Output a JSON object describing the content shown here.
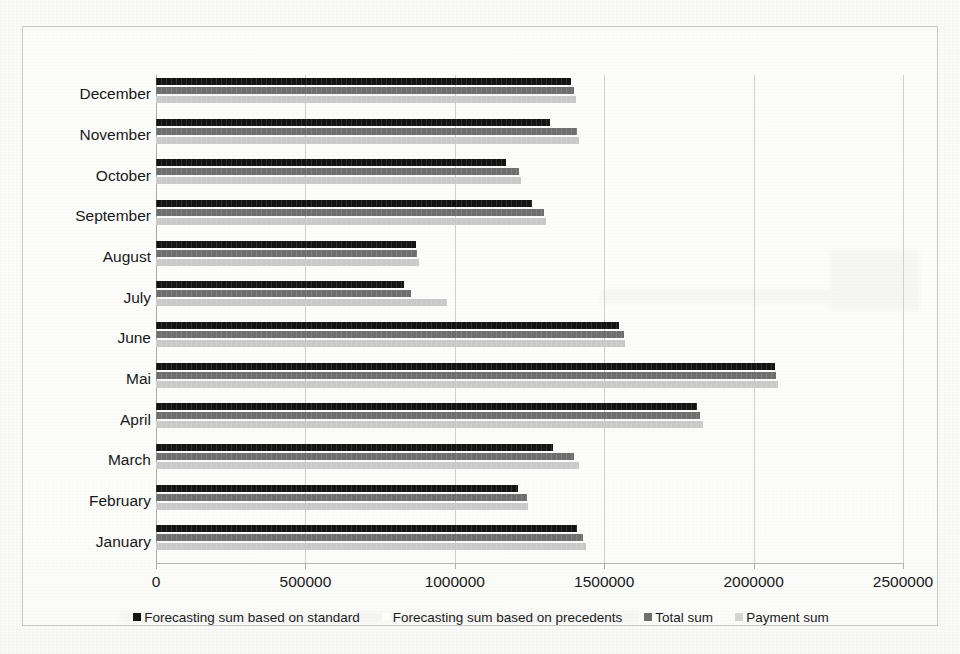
{
  "chart_data": {
    "type": "bar",
    "orientation": "horizontal",
    "title": "",
    "xlabel": "",
    "ylabel": "",
    "xlim": [
      0,
      2500000
    ],
    "grid": true,
    "legend_position": "bottom",
    "categories": [
      "December",
      "November",
      "October",
      "September",
      "August",
      "July",
      "June",
      "Mai",
      "April",
      "March",
      "February",
      "January"
    ],
    "xticks": [
      0,
      500000,
      1000000,
      1500000,
      2000000,
      2500000
    ],
    "xtick_labels": [
      "0",
      "500000",
      "1000000",
      "1500000",
      "2000000",
      "2500000"
    ],
    "series": [
      {
        "name": "Forecasting sum based on standard",
        "color": "#141414",
        "values": [
          1390000,
          1320000,
          1170000,
          1260000,
          870000,
          830000,
          1550000,
          2070000,
          1810000,
          1330000,
          1210000,
          1410000
        ]
      },
      {
        "name": "Forecasting sum based on precedents",
        "color": "#6e6e6e",
        "values": [
          1400000,
          1410000,
          1215000,
          1300000,
          875000,
          855000,
          1565000,
          2075000,
          1820000,
          1400000,
          1240000,
          1430000
        ]
      },
      {
        "name": "Total sum",
        "color": "#c9c9c9",
        "values": [
          1405000,
          1415000,
          1220000,
          1305000,
          880000,
          975000,
          1570000,
          2080000,
          1830000,
          1415000,
          1245000,
          1440000
        ]
      },
      {
        "name": "Payment sum",
        "color": "#f0f0ee",
        "values": [
          0,
          0,
          0,
          0,
          0,
          0,
          0,
          0,
          0,
          0,
          0,
          0
        ]
      }
    ]
  },
  "legend": {
    "items": [
      {
        "label": "Forecasting sum based on standard",
        "color": "#141414"
      },
      {
        "label": "Forecasting sum based on precedents",
        "color": "#ffffff"
      },
      {
        "label": "Total sum",
        "color": "#6e6e6e"
      },
      {
        "label": "Payment sum",
        "color": "#d4d4d4"
      }
    ]
  }
}
